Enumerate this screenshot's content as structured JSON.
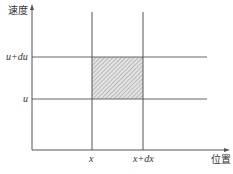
{
  "diagram": {
    "type": "velocity-position phase diagram",
    "y_axis_label": "速度",
    "x_axis_label": "位置",
    "y_ticks": [
      {
        "label": "u+du",
        "y": 70
      },
      {
        "label": "u",
        "y": 99
      }
    ],
    "x_ticks": [
      {
        "label": "x",
        "x": 92
      },
      {
        "label": "x+dx",
        "x": 143
      }
    ],
    "shaded_region": {
      "x_from": "x",
      "x_to": "x+dx",
      "y_from": "u",
      "y_to": "u+du"
    },
    "colors": {
      "axis": "#555555",
      "grid": "#666666",
      "hatch": "#999999",
      "text": "#333333"
    }
  }
}
